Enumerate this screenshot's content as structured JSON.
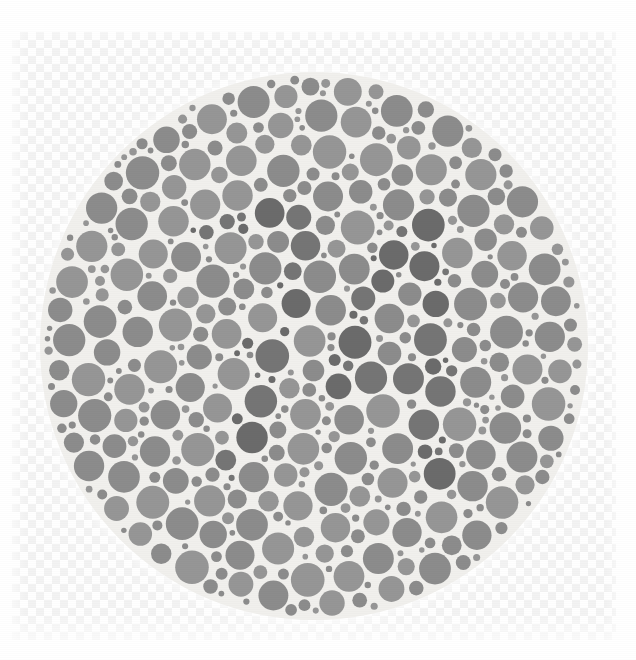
{
  "image": {
    "kind": "ishihara-plate",
    "title": "Ishihara color vision test plate (grayscale)",
    "width": 636,
    "height": 660,
    "alt_text": "Circular mosaic of gray dots of varying sizes forming a hidden numeral, shown on a transparency checkerboard background"
  },
  "backdrop": {
    "name": "transparency-checkerboard",
    "square_size_px": 8,
    "light_color": "#ffffff",
    "dark_color": "#f2f2f2",
    "left": 12,
    "top": 32,
    "width": 604,
    "height": 608
  },
  "plate": {
    "center_x": 314,
    "center_y": 346,
    "diameter": 548,
    "paper_color": "#f1f0ed",
    "dot_gap_color": "#f1f0ed",
    "background_dot_color": "#8c8c8c",
    "figure_dot_color": "#6b6b6b",
    "figure_dot_color_alt": "#757575",
    "background_dot_color_alt": "#969696",
    "hidden_figure": "74",
    "dot_count": 812,
    "min_dot_radius": 2,
    "max_dot_radius": 17
  },
  "chart_data": {
    "type": "scatter",
    "xlabel": "",
    "ylabel": "",
    "xlim": [
      0,
      548
    ],
    "ylim": [
      0,
      548
    ],
    "grid": false,
    "legend": "none",
    "annotations": [
      "hidden numeral rendered by darker dots"
    ],
    "series": [
      {
        "name": "background dots",
        "color": "#8c8c8c",
        "marker": "circle",
        "count": 640
      },
      {
        "name": "figure dots",
        "color": "#6b6b6b",
        "marker": "circle",
        "count": 172
      }
    ]
  }
}
